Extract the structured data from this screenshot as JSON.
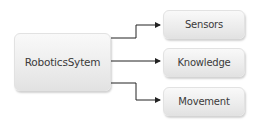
{
  "diagram": {
    "root": {
      "label": "RoboticsSytem"
    },
    "children": [
      {
        "label": "Sensors"
      },
      {
        "label": "Knowledge"
      },
      {
        "label": "Movement"
      }
    ],
    "colors": {
      "box_fill": "#ececec",
      "text": "#3a3a3a",
      "connector": "#222222"
    }
  }
}
